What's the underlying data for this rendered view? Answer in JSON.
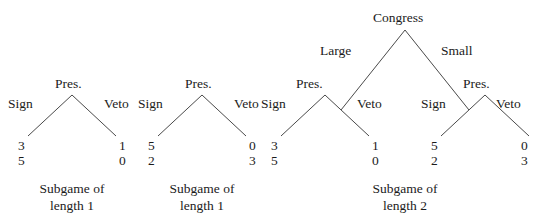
{
  "figure": {
    "kind": "extensive-form-game-tree-subgames",
    "background_color": "#ffffff",
    "line_color": "#4a4a4a",
    "text_color": "#1b1b1b"
  },
  "subgames": [
    {
      "id": "subgame-1",
      "caption_line1": "Subgame of",
      "caption_line2": "length 1",
      "root_player": "Pres.",
      "actions": {
        "left": "Sign",
        "right": "Veto"
      },
      "payoffs": {
        "left": {
          "top": "3",
          "bottom": "5"
        },
        "right": {
          "top": "1",
          "bottom": "0"
        }
      }
    },
    {
      "id": "subgame-2",
      "caption_line1": "Subgame of",
      "caption_line2": "length 1",
      "root_player": "Pres.",
      "actions": {
        "left": "Sign",
        "right": "Veto"
      },
      "payoffs": {
        "left": {
          "top": "5",
          "bottom": "2"
        },
        "right": {
          "top": "0",
          "bottom": "3"
        }
      }
    },
    {
      "id": "subgame-3",
      "caption_line1": "Subgame of",
      "caption_line2": "length 2",
      "root_player": "Congress",
      "actions": {
        "left": "Large",
        "right": "Small"
      },
      "left_branch": {
        "player": "Pres.",
        "actions": {
          "left": "Sign",
          "right": "Veto"
        },
        "payoffs": {
          "left": {
            "top": "3",
            "bottom": "5"
          },
          "right": {
            "top": "1",
            "bottom": "0"
          }
        }
      },
      "right_branch": {
        "player": "Pres.",
        "actions": {
          "left": "Sign",
          "right": "Veto"
        },
        "payoffs": {
          "left": {
            "top": "5",
            "bottom": "2"
          },
          "right": {
            "top": "0",
            "bottom": "3"
          }
        }
      }
    }
  ]
}
